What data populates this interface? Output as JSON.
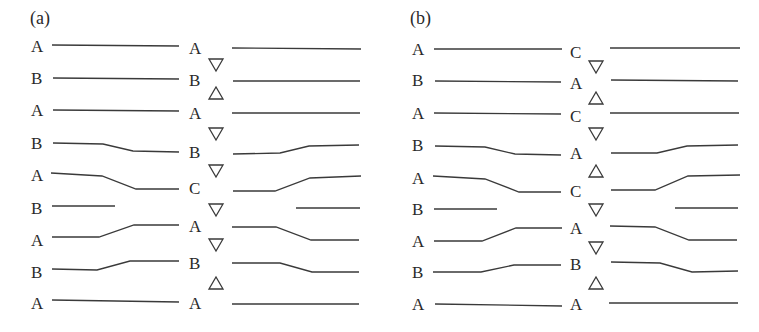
{
  "panels": [
    {
      "id": "a",
      "label": "(a)",
      "left_labels": [
        "A",
        "B",
        "A",
        "B",
        "A",
        "B",
        "A",
        "B",
        "A"
      ],
      "middle_labels": [
        "A",
        "B",
        "A",
        "B",
        "C",
        "",
        "A",
        "B",
        "A"
      ],
      "triangles": [
        "down",
        "up",
        "down",
        "down",
        "down",
        "down",
        "down",
        "up"
      ]
    },
    {
      "id": "b",
      "label": "(b)",
      "left_labels": [
        "A",
        "B",
        "A",
        "B",
        "A",
        "B",
        "A",
        "B",
        "A"
      ],
      "middle_labels": [
        "C",
        "A",
        "C",
        "A",
        "C",
        "",
        "A",
        "B",
        "A"
      ],
      "triangles": [
        "down",
        "up",
        "down",
        "up",
        "up",
        "down",
        "down",
        "up"
      ]
    }
  ],
  "legend": {
    "down_triangle": "▽",
    "up_triangle": "△"
  }
}
